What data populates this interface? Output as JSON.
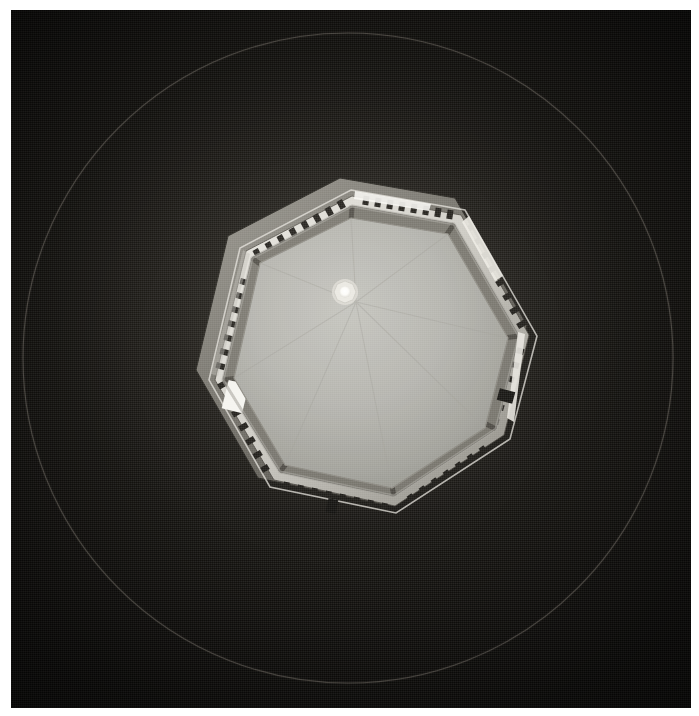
{
  "image": {
    "title": "Octagonal dome interior seen from below",
    "medium": "black-and-white photograph",
    "border_color": "#ffffff",
    "background_color": "#0c0b09",
    "caption": ""
  },
  "frame": {
    "border_left_px": 11,
    "border_top_px": 10,
    "border_right_px": 8,
    "border_bottom_px": 8,
    "plate_width_px": 680,
    "plate_height_px": 698
  },
  "guide_circle": {
    "name": "inscribed-circle",
    "center_x": 348,
    "center_y": 358,
    "radius": 325,
    "stroke_color": "#6e6a61",
    "stroke_width": 1.1
  },
  "dome": {
    "name": "octagonal-cupola",
    "sides": 8,
    "center_x": 348,
    "center_y": 330,
    "vertices": [
      {
        "x": 340,
        "y": 178
      },
      {
        "x": 455,
        "y": 198
      },
      {
        "x": 527,
        "y": 325
      },
      {
        "x": 500,
        "y": 430
      },
      {
        "x": 385,
        "y": 505
      },
      {
        "x": 258,
        "y": 478
      },
      {
        "x": 196,
        "y": 370
      },
      {
        "x": 228,
        "y": 236
      }
    ],
    "interior_color": "#b6b6b1",
    "cornice_color": "#cfcdc6",
    "shadow_color": "#4e4c46"
  },
  "oculus": {
    "name": "central-oculus",
    "center_x": 345,
    "center_y": 292,
    "radius": 11,
    "core_radius": 6,
    "core_color": "#fdfdfb",
    "ring_color": "#e8e7e0"
  },
  "balustrade": {
    "name": "balustrade-ring",
    "baluster_count": 72,
    "baluster_color": "#100f0d",
    "rail_color": "#d8d6cf"
  },
  "drum_windows": [
    {
      "id": "window-sw",
      "x": 300,
      "y": 432,
      "w": 26,
      "h": 17,
      "brightness": "#f6f5f0"
    },
    {
      "id": "window-s",
      "x": 398,
      "y": 430,
      "w": 22,
      "h": 14,
      "brightness": "#efeee8"
    },
    {
      "id": "window-w",
      "x": 216,
      "y": 376,
      "w": 20,
      "h": 27,
      "brightness": "#f4f3ee"
    },
    {
      "id": "window-nw",
      "x": 233,
      "y": 337,
      "w": 18,
      "h": 19,
      "brightness": "#cfcec7"
    },
    {
      "id": "window-e",
      "x": 455,
      "y": 330,
      "w": 17,
      "h": 24,
      "brightness": "#e3e1da"
    },
    {
      "id": "window-ne",
      "x": 446,
      "y": 296,
      "w": 16,
      "h": 17,
      "brightness": "#d6d4cd"
    },
    {
      "id": "window-n",
      "x": 411,
      "y": 253,
      "w": 15,
      "h": 15,
      "brightness": "#c9c7c0"
    },
    {
      "id": "window-se",
      "x": 347,
      "y": 450,
      "w": 17,
      "h": 12,
      "brightness": "#e2e0d9"
    }
  ],
  "highlights": [
    {
      "id": "highlight-top-ridge",
      "x": 352,
      "y": 186,
      "w": 74,
      "h": 16,
      "color": "#f7f6f1"
    },
    {
      "id": "highlight-upper-right",
      "x": 462,
      "y": 226,
      "w": 32,
      "h": 58,
      "color": "#eceae3"
    },
    {
      "id": "highlight-right-edge",
      "x": 497,
      "y": 310,
      "w": 20,
      "h": 44,
      "color": "#e6e4dd"
    }
  ]
}
